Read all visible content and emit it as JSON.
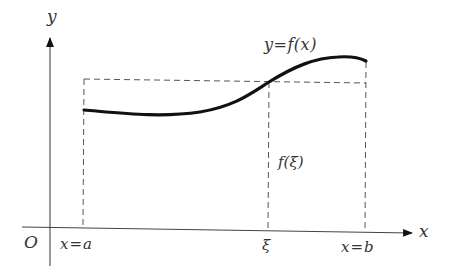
{
  "diagram": {
    "colors": {
      "curve": "#111111",
      "axis": "#444444",
      "dashed": "#555555",
      "text": "#333333",
      "background": "#ffffff"
    },
    "axes": {
      "x_label": "x",
      "y_label": "y",
      "origin_label": "O"
    },
    "curve_label": "y=f(x)",
    "value_label": "f(ξ)",
    "x_ticks": [
      {
        "id": "a",
        "label": "x=a"
      },
      {
        "id": "xi",
        "label": "ξ"
      },
      {
        "id": "b",
        "label": "x=b"
      }
    ]
  }
}
